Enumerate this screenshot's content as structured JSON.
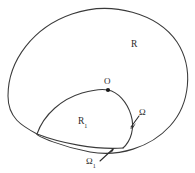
{
  "figure": {
    "kind": "region-diagram",
    "width": 195,
    "height": 173,
    "background_color": "#ffffff",
    "stroke_color": "#3a3a3a"
  },
  "labels": {
    "outer_region": "R",
    "inner_region_base": "R",
    "inner_region_sub": "1",
    "point_origin": "O",
    "outer_boundary": "Ω",
    "inner_boundary_base": "Ω",
    "inner_boundary_sub": "1"
  },
  "geometry": {
    "outer_curve_path": "M 8 96 C 8 60 34 27 72 14 C 112 0 158 14 177 42 C 194 68 190 104 170 126 C 150 148 118 157 90 152 C 62 147 37 136 37 134 C 22 126 8 118 8 96 Z",
    "inner_curve_upper_path": "M 37 134 C 44 114 62 99 82 93 C 96 89 104 89 108 90",
    "inner_curve_lower_path": "M 108 90 C 118 92 127 102 131 115 C 135 128 131 141 123 148",
    "inner_curve_close_path": "M 37 134 C 60 143 95 150 123 148",
    "point_origin_xy": [
      108,
      90
    ],
    "omega_leader": "M 139 116 L 131 127",
    "omega1_leader": "M 100 161 L 113 149"
  },
  "colors": {
    "stroke": "#3a3a3a",
    "text": "#2b2b2b",
    "marker": "#1a1a1a",
    "background": "#ffffff"
  }
}
